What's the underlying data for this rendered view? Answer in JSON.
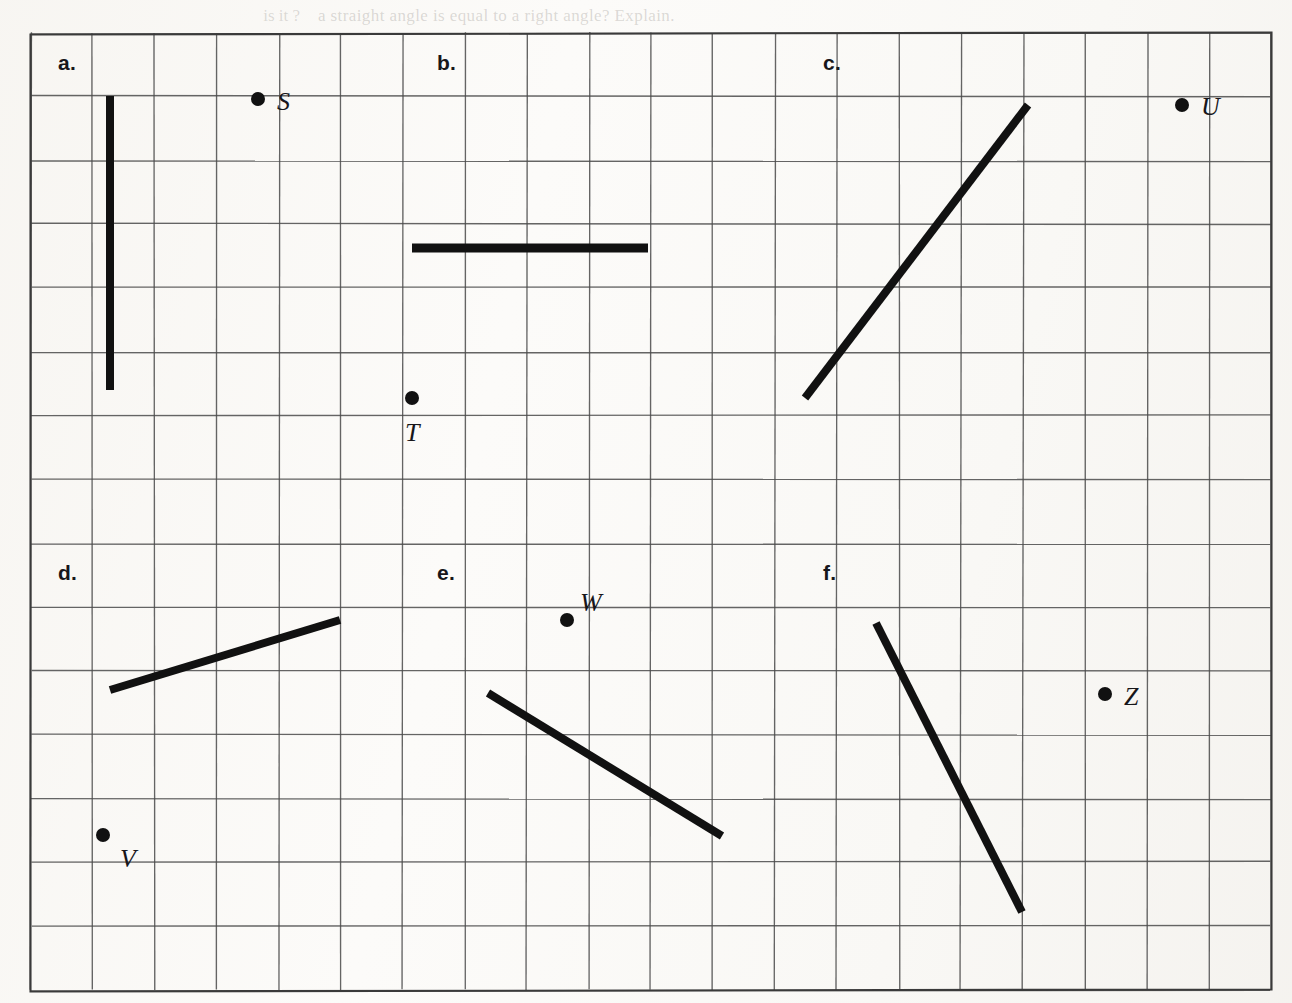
{
  "page": {
    "width": 1292,
    "height": 1003,
    "background_color": "#fbfaf8",
    "ink_color": "#111111",
    "grid_line_color": "#4b4b4b",
    "border_color": "#3a3a3a",
    "faint_bleed_text": "a straight angle is equal to a right angle? Explain.",
    "faint_bleed_text_left": "is it ?"
  },
  "grid": {
    "left": 31,
    "top": 33,
    "cols": 20,
    "rows": 15,
    "cell_width": 62,
    "cell_height": 63.8,
    "right": 1271,
    "bottom": 990
  },
  "part_labels": [
    {
      "id": "a",
      "text": "a.",
      "x": 58,
      "y": 52
    },
    {
      "id": "b",
      "text": "b.",
      "x": 437,
      "y": 52
    },
    {
      "id": "c",
      "text": "c.",
      "x": 823,
      "y": 52
    },
    {
      "id": "d",
      "text": "d.",
      "x": 58,
      "y": 562
    },
    {
      "id": "e",
      "text": "e.",
      "x": 437,
      "y": 562
    },
    {
      "id": "f",
      "text": "f.",
      "x": 823,
      "y": 562
    }
  ],
  "segments": [
    {
      "id": "segment-a",
      "part": "a",
      "x1": 110,
      "y1": 96,
      "x2": 110,
      "y2": 390,
      "stroke_width": 8,
      "orientation": "vertical"
    },
    {
      "id": "segment-b",
      "part": "b",
      "x1": 412,
      "y1": 248,
      "x2": 648,
      "y2": 248,
      "stroke_width": 9,
      "orientation": "horizontal"
    },
    {
      "id": "segment-c",
      "part": "c",
      "x1": 805,
      "y1": 398,
      "x2": 1028,
      "y2": 105,
      "stroke_width": 8,
      "orientation": "diagonal-up"
    },
    {
      "id": "segment-d",
      "part": "d",
      "x1": 110,
      "y1": 690,
      "x2": 340,
      "y2": 620,
      "stroke_width": 8,
      "orientation": "diagonal-up-shallow"
    },
    {
      "id": "segment-e",
      "part": "e",
      "x1": 488,
      "y1": 693,
      "x2": 722,
      "y2": 836,
      "stroke_width": 8,
      "orientation": "diagonal-down"
    },
    {
      "id": "segment-f",
      "part": "f",
      "x1": 876,
      "y1": 623,
      "x2": 1022,
      "y2": 912,
      "stroke_width": 8,
      "orientation": "diagonal-down-steep"
    }
  ],
  "points": [
    {
      "id": "point-S",
      "label": "S",
      "x": 258,
      "y": 99,
      "label_x": 277,
      "label_y": 89,
      "radius": 7
    },
    {
      "id": "point-T",
      "label": "T",
      "x": 412,
      "y": 398,
      "label_x": 405,
      "label_y": 420,
      "radius": 7
    },
    {
      "id": "point-U",
      "label": "U",
      "x": 1182,
      "y": 105,
      "label_x": 1201,
      "label_y": 94,
      "radius": 7
    },
    {
      "id": "point-V",
      "label": "V",
      "x": 103,
      "y": 835,
      "label_x": 120,
      "label_y": 846,
      "radius": 7
    },
    {
      "id": "point-W",
      "label": "W",
      "x": 567,
      "y": 620,
      "label_x": 580,
      "label_y": 590,
      "radius": 7
    },
    {
      "id": "point-Z",
      "label": "Z",
      "x": 1105,
      "y": 694,
      "label_x": 1124,
      "label_y": 684,
      "radius": 7
    }
  ],
  "chart_data": {
    "type": "diagram",
    "grid_units": {
      "cell_width_px": 62,
      "cell_height_px": 63.8,
      "columns": 20,
      "rows": 15
    },
    "segments_in_grid_units": [
      {
        "part": "a",
        "from": [
          1.27,
          0.99
        ],
        "to": [
          1.27,
          5.6
        ],
        "run": 0,
        "rise": -4.61,
        "slope": "undefined (vertical)"
      },
      {
        "part": "b",
        "from": [
          6.15,
          3.37
        ],
        "to": [
          9.95,
          3.37
        ],
        "run": 3.8,
        "rise": 0,
        "slope": 0
      },
      {
        "part": "c",
        "from": [
          12.48,
          5.72
        ],
        "to": [
          16.08,
          1.13
        ],
        "run": 3.6,
        "rise": 4.59,
        "slope": 1.28
      },
      {
        "part": "d",
        "from": [
          1.27,
          10.3
        ],
        "to": [
          4.98,
          9.2
        ],
        "run": 3.71,
        "rise": 1.1,
        "slope": 0.3
      },
      {
        "part": "e",
        "from": [
          7.37,
          10.34
        ],
        "to": [
          11.15,
          12.59
        ],
        "run": 3.78,
        "rise": -2.25,
        "slope": -0.6
      },
      {
        "part": "f",
        "from": [
          13.63,
          9.25
        ],
        "to": [
          15.98,
          13.78
        ],
        "run": 2.35,
        "rise": -4.53,
        "slope": -1.93
      }
    ],
    "points_in_grid_units": [
      {
        "label": "S",
        "position": [
          3.66,
          1.03
        ]
      },
      {
        "label": "T",
        "position": [
          6.15,
          5.72
        ]
      },
      {
        "label": "U",
        "position": [
          18.56,
          1.13
        ]
      },
      {
        "label": "V",
        "position": [
          1.16,
          12.57
        ]
      },
      {
        "label": "W",
        "position": [
          8.65,
          9.2
        ]
      },
      {
        "label": "Z",
        "position": [
          17.32,
          10.36
        ]
      }
    ]
  }
}
